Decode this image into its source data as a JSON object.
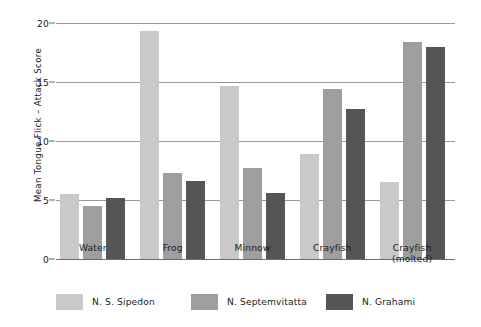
{
  "chart_data": {
    "type": "bar",
    "title": "",
    "xlabel": "",
    "ylabel": "Mean Tongue Flick – Attack Score",
    "ylim": [
      0,
      20
    ],
    "yticks": [
      0,
      5,
      10,
      15,
      20
    ],
    "ytick_labels": [
      "0",
      "5",
      "10",
      "15",
      "20"
    ],
    "grid": true,
    "legend_position": "bottom",
    "categories": [
      "Water",
      "Frog",
      "Minnow",
      "Crayfish",
      "Crayfish\n(molted)"
    ],
    "series": [
      {
        "name": "N. S. Sipedon",
        "color": "#c9c9c9",
        "values": [
          5.5,
          19.3,
          14.7,
          8.9,
          6.5
        ]
      },
      {
        "name": "N. Septemvitatta",
        "color": "#9e9e9e",
        "values": [
          4.5,
          7.3,
          7.7,
          14.4,
          18.4
        ]
      },
      {
        "name": "N. Grahami",
        "color": "#555555",
        "values": [
          5.2,
          6.6,
          5.6,
          12.7,
          18.0
        ]
      }
    ]
  },
  "colors": {
    "background": "#ffffff",
    "axis": "#6d6d6d",
    "gridline": "#9a9a9a",
    "text": "#1a1a1a"
  }
}
